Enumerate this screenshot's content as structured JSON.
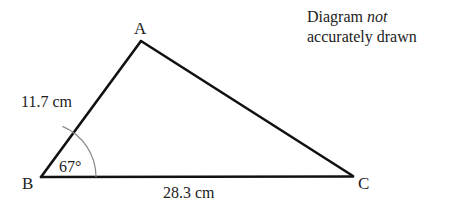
{
  "diagram": {
    "type": "triangle",
    "vertices": {
      "A": {
        "label": "A",
        "x": 141,
        "y": 41
      },
      "B": {
        "label": "B",
        "x": 41,
        "y": 177
      },
      "C": {
        "label": "C",
        "x": 353,
        "y": 176
      }
    },
    "sides": {
      "AB": {
        "label": "11.7 cm",
        "value": 11.7,
        "unit": "cm"
      },
      "BC": {
        "label": "28.3 cm",
        "value": 28.3,
        "unit": "cm"
      }
    },
    "angles": {
      "B": {
        "label": "67°",
        "value": 67,
        "unit": "degrees"
      }
    },
    "note": {
      "line1_prefix": "Diagram ",
      "line1_italic": "not",
      "line2": "accurately drawn"
    }
  },
  "colors": {
    "line": "#111111",
    "arc": "#8a8a8a",
    "text": "#222222",
    "background": "#ffffff"
  }
}
